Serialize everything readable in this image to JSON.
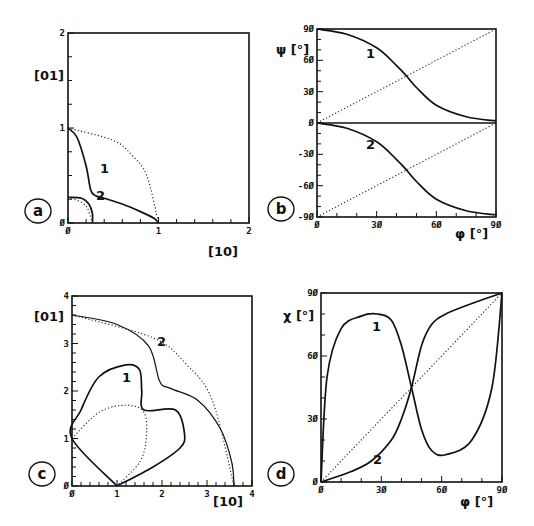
{
  "figure": {
    "panels": [
      {
        "id": "a",
        "label": "a",
        "xlabel": "[10]",
        "ylabel": "[01]",
        "xticks": [
          "0",
          "1",
          "2"
        ],
        "yticks": [
          "0",
          "1",
          "2"
        ],
        "curve_labels": [
          "1",
          "2"
        ]
      },
      {
        "id": "b",
        "label": "b",
        "xlabel": "φ [°]",
        "ylabel": "ψ [°]",
        "xticks": [
          "0",
          "30",
          "60",
          "90"
        ],
        "yticks": [
          "90",
          "60",
          "30",
          "0",
          "-30",
          "-60",
          "-90"
        ],
        "curve_labels": [
          "1",
          "2"
        ]
      },
      {
        "id": "c",
        "label": "c",
        "xlabel": "[10]",
        "ylabel": "[01]",
        "xticks": [
          "0",
          "1",
          "2",
          "3",
          "4"
        ],
        "yticks": [
          "0",
          "1",
          "2",
          "3",
          "4"
        ],
        "curve_labels": [
          "1",
          "2"
        ]
      },
      {
        "id": "d",
        "label": "d",
        "xlabel": "φ [°]",
        "ylabel": "χ [°]",
        "xticks": [
          "0",
          "30",
          "60",
          "90"
        ],
        "yticks": [
          "0",
          "30",
          "60",
          "90"
        ],
        "curve_labels": [
          "1",
          "2"
        ]
      }
    ]
  },
  "chart_data": [
    {
      "panel": "a",
      "type": "line",
      "xlabel": "[10]",
      "ylabel": "[01]",
      "xlim": [
        0,
        2
      ],
      "ylim": [
        0,
        2
      ],
      "grid": false,
      "series": [
        {
          "name": "1",
          "style": "solid",
          "x": [
            0,
            0.1,
            0.2,
            0.25,
            0.3,
            0.4,
            0.6,
            0.8,
            0.95,
            1.0
          ],
          "y": [
            1.0,
            0.9,
            0.6,
            0.35,
            0.29,
            0.26,
            0.2,
            0.12,
            0.05,
            0.0
          ]
        },
        {
          "name": "1 reference (unit circle)",
          "style": "dotted",
          "x": [
            0,
            0.5,
            0.71,
            0.87,
            1.0
          ],
          "y": [
            1.0,
            0.87,
            0.71,
            0.5,
            0.0
          ]
        },
        {
          "name": "2",
          "style": "solid",
          "x": [
            0,
            0.15,
            0.23,
            0.27,
            0.27
          ],
          "y": [
            0.27,
            0.26,
            0.2,
            0.1,
            0.0
          ]
        },
        {
          "name": "2 reference (quarter circle r=0.27)",
          "style": "dotted",
          "x": [
            0,
            0.19,
            0.27
          ],
          "y": [
            0.27,
            0.19,
            0.0
          ]
        }
      ]
    },
    {
      "panel": "b",
      "type": "line",
      "xlabel": "φ [°]",
      "ylabel": "ψ [°]",
      "xlim": [
        0,
        90
      ],
      "ylim": [
        -90,
        90
      ],
      "grid": false,
      "series": [
        {
          "name": "1",
          "style": "solid",
          "x": [
            0,
            15,
            30,
            40,
            45,
            50,
            60,
            75,
            90
          ],
          "y": [
            90,
            85,
            72,
            55,
            45,
            34,
            17,
            6,
            2
          ]
        },
        {
          "name": "2",
          "style": "solid",
          "x": [
            0,
            15,
            30,
            40,
            45,
            50,
            60,
            75,
            90
          ],
          "y": [
            0,
            -5,
            -18,
            -35,
            -45,
            -56,
            -73,
            -84,
            -88
          ]
        },
        {
          "name": "diagonal upper",
          "style": "dotted",
          "x": [
            0,
            90
          ],
          "y": [
            0,
            90
          ]
        },
        {
          "name": "diagonal lower",
          "style": "dotted",
          "x": [
            0,
            90
          ],
          "y": [
            -90,
            0
          ]
        }
      ]
    },
    {
      "panel": "c",
      "type": "line",
      "xlabel": "[10]",
      "ylabel": "[01]",
      "xlim": [
        0,
        4
      ],
      "ylim": [
        0,
        4
      ],
      "grid": false,
      "series": [
        {
          "name": "1",
          "style": "solid",
          "closed": true,
          "x": [
            1.0,
            1.8,
            2.4,
            2.5,
            2.3,
            1.6,
            1.55,
            1.5,
            1.2,
            0.6,
            0.2,
            0.0,
            1.0
          ],
          "y": [
            0.0,
            0.4,
            0.8,
            1.1,
            1.6,
            1.6,
            2.0,
            2.45,
            2.55,
            2.3,
            1.6,
            1.0,
            0.0
          ]
        },
        {
          "name": "1 reference",
          "style": "dotted",
          "x": [
            0,
            0.6,
            1.2,
            1.6,
            1.65,
            1.5,
            1.0
          ],
          "y": [
            1.0,
            1.55,
            1.7,
            1.55,
            1.0,
            0.5,
            0.0
          ]
        },
        {
          "name": "2",
          "style": "solid",
          "x": [
            0,
            1.0,
            1.7,
            1.95,
            2.2,
            2.8,
            3.3,
            3.55,
            3.6
          ],
          "y": [
            3.6,
            3.4,
            2.95,
            2.2,
            2.05,
            1.8,
            1.2,
            0.5,
            0.0
          ]
        },
        {
          "name": "2 reference (circle r=3.6)",
          "style": "dotted",
          "x": [
            0,
            1.8,
            2.55,
            3.12,
            3.6
          ],
          "y": [
            3.6,
            3.12,
            2.55,
            1.8,
            0.0
          ]
        }
      ]
    },
    {
      "panel": "d",
      "type": "line",
      "xlabel": "φ [°]",
      "ylabel": "χ [°]",
      "xlim": [
        0,
        90
      ],
      "ylim": [
        0,
        90
      ],
      "grid": false,
      "series": [
        {
          "name": "1",
          "style": "solid",
          "x": [
            0,
            3,
            10,
            20,
            28,
            35,
            40,
            45,
            50,
            55,
            62,
            75,
            85,
            90
          ],
          "y": [
            0,
            50,
            73,
            79,
            80,
            77,
            65,
            45,
            25,
            15,
            13,
            20,
            45,
            90
          ]
        },
        {
          "name": "2",
          "style": "solid",
          "x": [
            0,
            15,
            25,
            35,
            40,
            45,
            50,
            55,
            62,
            75,
            90
          ],
          "y": [
            0,
            5,
            10,
            20,
            30,
            45,
            65,
            75,
            80,
            85,
            90
          ]
        },
        {
          "name": "diagonal",
          "style": "dotted",
          "x": [
            0,
            90
          ],
          "y": [
            0,
            90
          ]
        }
      ]
    }
  ]
}
